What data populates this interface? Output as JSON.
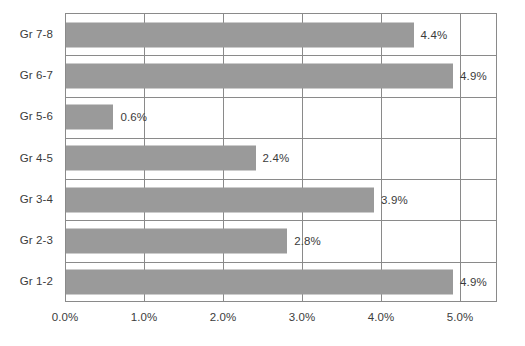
{
  "chart_data": {
    "type": "bar",
    "orientation": "horizontal",
    "title": "",
    "subtitle": "",
    "xlabel": "",
    "ylabel": "",
    "categories": [
      "Gr 1-2",
      "Gr 2-3",
      "Gr 3-4",
      "Gr 4-5",
      "Gr 5-6",
      "Gr 6-7",
      "Gr 7-8"
    ],
    "values": [
      4.9,
      2.8,
      3.9,
      2.4,
      0.6,
      4.9,
      4.4
    ],
    "data_labels": [
      "4.9%",
      "2.8%",
      "3.9%",
      "2.4%",
      "0.6%",
      "4.9%",
      "4.4%"
    ],
    "display_order_top_to_bottom": [
      "Gr 7-8",
      "Gr 6-7",
      "Gr 5-6",
      "Gr 4-5",
      "Gr 3-4",
      "Gr 2-3",
      "Gr 1-2"
    ],
    "xlim": [
      0.0,
      5.47
    ],
    "xticks": [
      0.0,
      1.0,
      2.0,
      3.0,
      4.0,
      5.0
    ],
    "xtick_labels": [
      "0.0%",
      "1.0%",
      "2.0%",
      "3.0%",
      "4.0%",
      "5.0%"
    ],
    "grid": {
      "vertical": true,
      "horizontal": true
    },
    "legend": {
      "visible": false,
      "position": "none"
    },
    "colors": {
      "bar_fill": "#9a9a9a",
      "grid": "#8a8a8a",
      "axis": "#8a8a8a",
      "text": "#3b3b3b",
      "background": "#ffffff"
    }
  },
  "rows": [
    {
      "category": "Gr 7-8",
      "value": 4.4,
      "label": "4.4%"
    },
    {
      "category": "Gr 6-7",
      "value": 4.9,
      "label": "4.9%"
    },
    {
      "category": "Gr 5-6",
      "value": 0.6,
      "label": "0.6%"
    },
    {
      "category": "Gr 4-5",
      "value": 2.4,
      "label": "2.4%"
    },
    {
      "category": "Gr 3-4",
      "value": 3.9,
      "label": "3.9%"
    },
    {
      "category": "Gr 2-3",
      "value": 2.8,
      "label": "2.8%"
    },
    {
      "category": "Gr 1-2",
      "value": 4.9,
      "label": "4.9%"
    }
  ],
  "xticks": [
    {
      "label": "0.0%",
      "value": 0.0
    },
    {
      "label": "1.0%",
      "value": 1.0
    },
    {
      "label": "2.0%",
      "value": 2.0
    },
    {
      "label": "3.0%",
      "value": 3.0
    },
    {
      "label": "4.0%",
      "value": 4.0
    },
    {
      "label": "5.0%",
      "value": 5.0
    }
  ]
}
